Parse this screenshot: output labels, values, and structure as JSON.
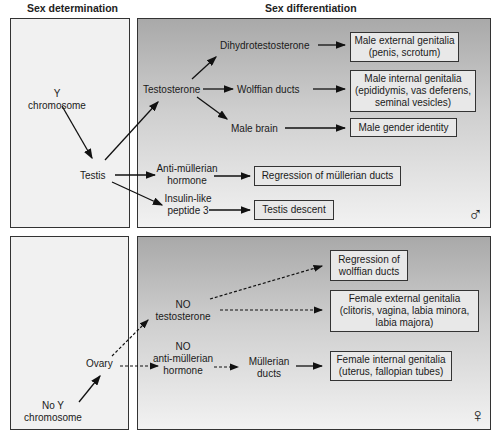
{
  "headers": {
    "left": "Sex determination",
    "right": "Sex differentiation"
  },
  "male": {
    "y_chromosome": [
      "Y",
      "chromosome"
    ],
    "testis": "Testis",
    "testosterone": "Testosterone",
    "dht": "Dihydrotestosterone",
    "wolffian": "Wolffian ducts",
    "male_brain": "Male brain",
    "amh": [
      "Anti-müllerian",
      "hormone"
    ],
    "insl3": [
      "Insulin-like",
      "peptide 3"
    ],
    "boxes": {
      "external": [
        "Male external genitalia",
        "(penis, scrotum)"
      ],
      "internal": [
        "Male internal genitalia",
        "(epididymis, vas deferens,",
        "seminal vesicles)"
      ],
      "identity": [
        "Male gender identity"
      ],
      "mullerian_regression": [
        "Regression of müllerian ducts"
      ],
      "testis_descent": [
        "Testis descent"
      ]
    },
    "symbol": "♂"
  },
  "female": {
    "no_y": [
      "No Y",
      "chromosome"
    ],
    "ovary": "Ovary",
    "no_testosterone": [
      "NO",
      "testosterone"
    ],
    "no_amh": [
      "NO",
      "anti-müllerian",
      "hormone"
    ],
    "mullerian": [
      "Müllerian",
      "ducts"
    ],
    "boxes": {
      "wolffian_regression": [
        "Regression of",
        "wolffian ducts"
      ],
      "external": [
        "Female external genitalia",
        "(clitoris, vagina, labia minora,",
        "labia majora)"
      ],
      "internal": [
        "Female internal genitalia",
        "(uterus, fallopian tubes)"
      ]
    },
    "symbol": "♀"
  }
}
